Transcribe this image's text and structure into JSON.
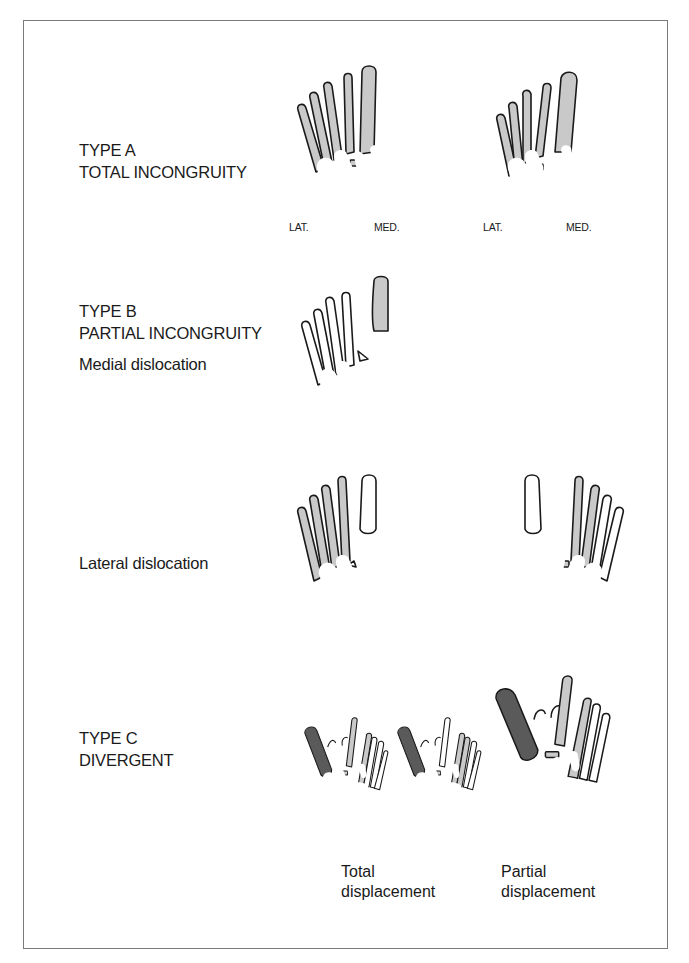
{
  "figure": {
    "sections": [
      {
        "id": "type-a",
        "title": "TYPE A",
        "subtitle": "TOTAL INCONGRUITY",
        "feet": [
          {
            "lat_label": "LAT.",
            "med_label": "MED.",
            "shaded": "all-metatarsals-light-gray"
          },
          {
            "lat_label": "LAT.",
            "med_label": "MED.",
            "shaded": "all-metatarsals-light-gray"
          }
        ]
      },
      {
        "id": "type-b",
        "title": "TYPE B",
        "subtitle": "PARTIAL INCONGRUITY",
        "subsections": [
          {
            "label": "Medial dislocation",
            "shaded": "first-metatarsal-light-gray"
          },
          {
            "label": "Lateral dislocation",
            "shaded": "lateral-metatarsals-light-gray"
          }
        ]
      },
      {
        "id": "type-c",
        "title": "TYPE C",
        "subtitle": "DIVERGENT",
        "captions": [
          {
            "line1": "Total",
            "line2": "displacement"
          },
          {
            "line1": "Partial",
            "line2": "displacement"
          }
        ]
      }
    ],
    "colors": {
      "outline": "#1a1a1a",
      "light_shade": "#c9c9c9",
      "dark_shade": "#5a5a5a",
      "frame": "#7a7a7a",
      "background": "#ffffff"
    }
  }
}
